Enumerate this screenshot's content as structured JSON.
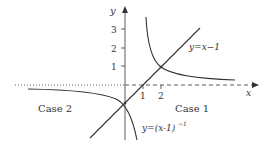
{
  "diagram": {
    "axes": {
      "x_label": "x",
      "y_label": "y",
      "x_ticks": [
        "1",
        "2"
      ],
      "y_ticks": [
        "1",
        "2",
        "3"
      ]
    },
    "curves": [
      {
        "name": "line",
        "label": "y=x−1"
      },
      {
        "name": "hyperbola",
        "label": "y=(x-1)",
        "label_sup": "−1"
      }
    ],
    "regions": [
      {
        "label": "Case 1"
      },
      {
        "label": "Case 2"
      }
    ],
    "colors": {
      "stroke": "#333333",
      "background": "#ffffff"
    }
  }
}
